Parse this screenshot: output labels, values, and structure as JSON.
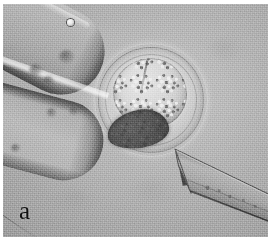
{
  "figure": {
    "panel_label": "a",
    "caption_type": "light-microscopy-micrograph",
    "modality": "phase-contrast / Hoffman modulation brightfield",
    "background_color": "#a7a7a7",
    "border_color": "#ffffff"
  },
  "specimen": {
    "name": "oocyte",
    "structures": [
      {
        "name": "zona-pellucida",
        "description": "clear outer ring",
        "color": "#c4c4c4"
      },
      {
        "name": "perivitelline-space",
        "description": "narrow gap inside zona",
        "color": "#b4b4b4"
      },
      {
        "name": "cytoplasm",
        "description": "bright granular mass, upper region",
        "color": "#d8d8d8"
      },
      {
        "name": "dark-mass",
        "description": "dark crescent body, lower-left of cell",
        "color": "#454545"
      }
    ]
  },
  "instruments": [
    {
      "name": "holding-pipette",
      "position": "left",
      "description": "blunt two-pronged holding pipette entering from the upper-left",
      "color": "#aeaeae"
    },
    {
      "name": "injection-needle",
      "position": "lower-right",
      "description": "beveled sharp micro-injection needle pointing toward the oocyte",
      "color": "#9a9a9a"
    }
  ],
  "annotations": {
    "bubble": {
      "name": "air-bubble",
      "description": "small bright bubble on pipette edge"
    },
    "debris": {
      "name": "intraluminal-debris",
      "description": "dark blurred particles inside the holding pipette",
      "count": 6
    }
  }
}
